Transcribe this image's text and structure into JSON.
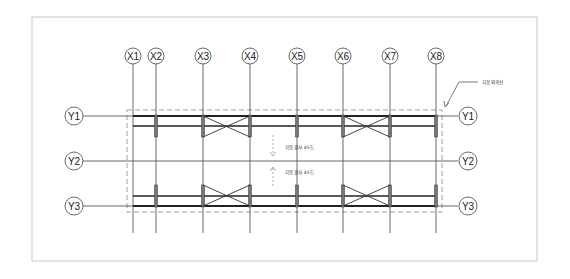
{
  "drawing": {
    "frame_color": "#c8c8c8",
    "line_color": "#333333",
    "x_axes": [
      {
        "label": "X1",
        "x": 133
      },
      {
        "label": "X2",
        "x": 156
      },
      {
        "label": "X3",
        "x": 203
      },
      {
        "label": "X4",
        "x": 250
      },
      {
        "label": "X5",
        "x": 297
      },
      {
        "label": "X6",
        "x": 343
      },
      {
        "label": "X7",
        "x": 390
      },
      {
        "label": "X8",
        "x": 436
      }
    ],
    "y_axes": [
      {
        "label": "Y1",
        "y": 116
      },
      {
        "label": "Y2",
        "y": 161
      },
      {
        "label": "Y3",
        "y": 206
      }
    ],
    "annotations": {
      "roof_outline": "지붕 외곽선",
      "slope_top": "지붕 경사 45도",
      "slope_bottom": "지붕 경사 45도"
    }
  }
}
